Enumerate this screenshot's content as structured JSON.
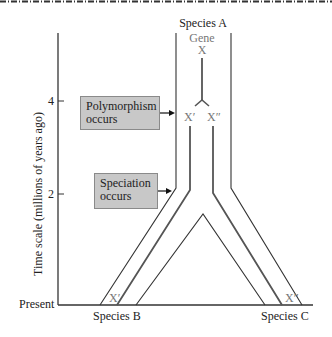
{
  "diagram": {
    "title_top": "Species A",
    "gene_label": "Gene",
    "gene_symbol": "X",
    "allele_left": "X′",
    "allele_right": "X″",
    "axis": {
      "label": "Time scale (millions of years ago)",
      "ticks": [
        {
          "value": "4",
          "y": 101
        },
        {
          "value": "2",
          "y": 194
        }
      ],
      "baseline_label": "Present"
    },
    "annotations": {
      "polymorphism": "Polymorphism occurs",
      "polymorphism_line1": "Polymorphism",
      "polymorphism_line2": "occurs",
      "speciation_line1": "Speciation",
      "speciation_line2": "occurs"
    },
    "descendants": {
      "left_species": "Species B",
      "left_allele": "X′",
      "right_species": "Species C",
      "right_allele": "X″"
    },
    "colors": {
      "box_fill": "#c8c8c8",
      "box_border": "#8a8a8a",
      "line": "#333333",
      "gene_line": "#555555",
      "gray_text": "#777777"
    }
  }
}
